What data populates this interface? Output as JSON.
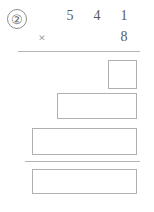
{
  "problem": {
    "number_label": "②",
    "multiplicand_digits": [
      "5",
      "4",
      "1"
    ],
    "operator": "×",
    "multiplier": "8"
  },
  "answer_boxes": [
    {
      "name": "partial-product-1",
      "value": ""
    },
    {
      "name": "partial-product-2",
      "value": ""
    },
    {
      "name": "partial-product-3",
      "value": ""
    },
    {
      "name": "total-product",
      "value": ""
    }
  ],
  "colors": {
    "ink": "#5a5a5a",
    "rule": "#b4b4b4",
    "box_border": "#b0b0b0",
    "page_background": "#ffffff"
  }
}
